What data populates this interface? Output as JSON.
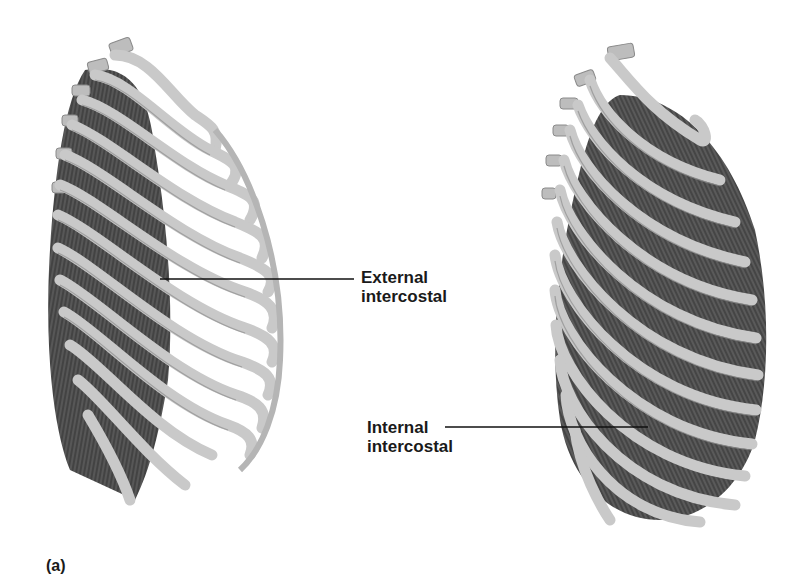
{
  "figure": {
    "panel_label": "(a)",
    "views": [
      {
        "name": "left-ribcage",
        "structure": "External intercostal"
      },
      {
        "name": "right-ribcage",
        "structure": "Internal intercostal"
      }
    ]
  },
  "labels": {
    "external": {
      "line1": "External",
      "line2": "intercostal"
    },
    "internal": {
      "line1": "Internal",
      "line2": "intercostal"
    }
  },
  "colors": {
    "bone": "#c8c8c8",
    "bone_edge": "#8a8a8a",
    "muscle": "#4a4a4a",
    "leader_line": "#111111",
    "text": "#1a1a1a"
  }
}
